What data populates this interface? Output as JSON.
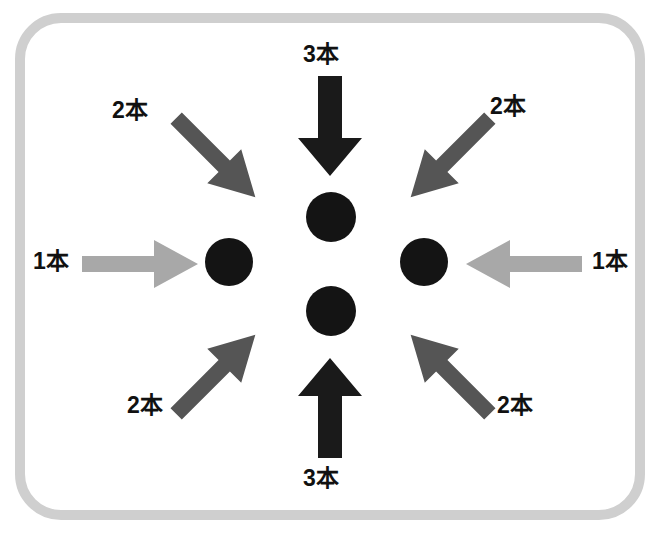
{
  "diagram": {
    "title": "",
    "frame": {
      "shape": "rounded-rectangle",
      "border_color": "#cfcfcf",
      "background_color": "#ffffff"
    },
    "colors": {
      "circle": "#141414",
      "arrow_black": "#1a1a1a",
      "arrow_dark_gray": "#555555",
      "arrow_light_gray": "#a8a8a8",
      "frame_border": "#cfcfcf",
      "label_text": "#111111"
    },
    "nodes": [
      {
        "id": "top-circle",
        "position": "top",
        "color": "#141414"
      },
      {
        "id": "left-circle",
        "position": "left",
        "color": "#141414"
      },
      {
        "id": "right-circle",
        "position": "right",
        "color": "#141414"
      },
      {
        "id": "bottom-circle",
        "position": "bottom",
        "color": "#141414"
      }
    ],
    "arrows": [
      {
        "id": "arrow-top",
        "direction": "down",
        "from": "top",
        "style": "black",
        "color": "#1a1a1a",
        "label": "3本"
      },
      {
        "id": "arrow-bottom",
        "direction": "up",
        "from": "bottom",
        "style": "black",
        "color": "#1a1a1a",
        "label": "3本"
      },
      {
        "id": "arrow-left",
        "direction": "right",
        "from": "left",
        "style": "light-gray",
        "color": "#a8a8a8",
        "label": "1本"
      },
      {
        "id": "arrow-right",
        "direction": "left",
        "from": "right",
        "style": "light-gray",
        "color": "#a8a8a8",
        "label": "1本"
      },
      {
        "id": "arrow-top-left",
        "direction": "down-right",
        "from": "top-left",
        "style": "dark-gray",
        "color": "#555555",
        "label": "2本"
      },
      {
        "id": "arrow-top-right",
        "direction": "down-left",
        "from": "top-right",
        "style": "dark-gray",
        "color": "#555555",
        "label": "2本"
      },
      {
        "id": "arrow-bottom-left",
        "direction": "up-right",
        "from": "bottom-left",
        "style": "dark-gray",
        "color": "#555555",
        "label": "2本"
      },
      {
        "id": "arrow-bottom-right",
        "direction": "up-left",
        "from": "bottom-right",
        "style": "dark-gray",
        "color": "#555555",
        "label": "2本"
      }
    ],
    "labels": {
      "top": "3本",
      "bottom": "3本",
      "left": "1本",
      "right": "1本",
      "top_left": "2本",
      "top_right": "2本",
      "bottom_left": "2本",
      "bottom_right": "2本"
    }
  }
}
